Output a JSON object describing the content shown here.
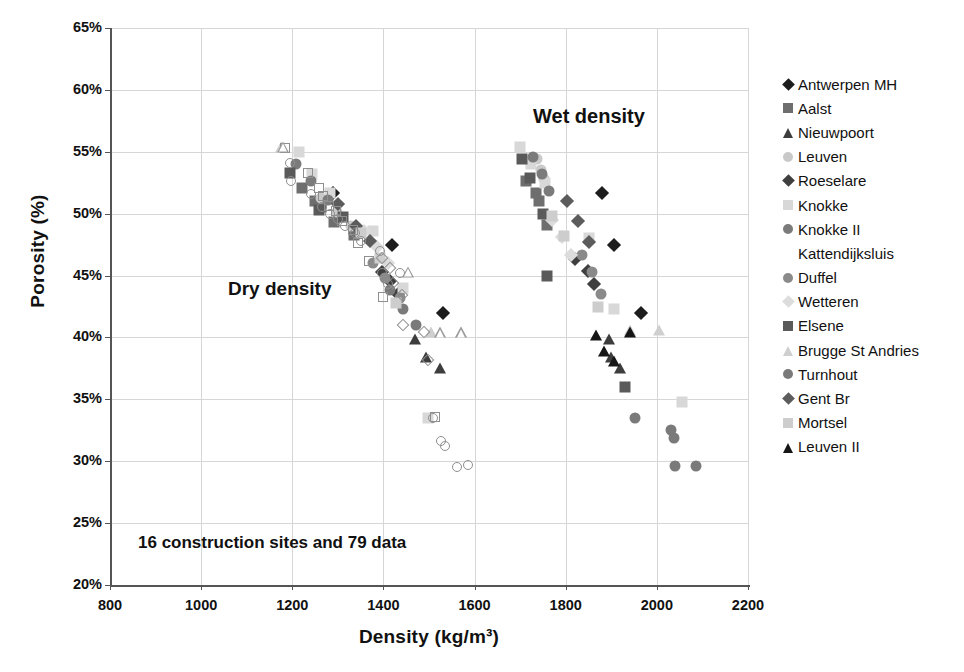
{
  "chart_data": {
    "type": "scatter",
    "title": "",
    "xlabel": "Density (kg/m³)",
    "ylabel": "Porosity (%)",
    "xlim": [
      800,
      2200
    ],
    "ylim": [
      20,
      65
    ],
    "xticks": [
      800,
      1000,
      1200,
      1400,
      1600,
      1800,
      2000,
      2200
    ],
    "yticks": [
      "20%",
      "25%",
      "30%",
      "35%",
      "40%",
      "45%",
      "50%",
      "55%",
      "60%",
      "65%"
    ],
    "ytick_values": [
      20,
      25,
      30,
      35,
      40,
      45,
      50,
      55,
      60,
      65
    ],
    "grid": true,
    "legend_position": "right",
    "annotations": [
      {
        "text": "Dry density",
        "x": 1300,
        "y": 45.5
      },
      {
        "text": "Wet density",
        "x": 1760,
        "y": 59.0
      },
      {
        "text": "16 construction sites and 79 data",
        "x": 860,
        "y": 24.2
      }
    ],
    "series": [
      {
        "name": "Antwerpen MH",
        "marker": "diamond",
        "color": "#1d1d1d",
        "size": 10,
        "points": [
          [
            1290,
            51.7
          ],
          [
            1419,
            47.5
          ],
          [
            1530,
            42.0
          ],
          [
            1880,
            51.7
          ],
          [
            1905,
            47.5
          ],
          [
            1966,
            42.0
          ]
        ]
      },
      {
        "name": "Aalst",
        "marker": "square",
        "color": "#6e6e6e",
        "size": 11,
        "points": [
          [
            1222,
            52.1
          ],
          [
            1249,
            51.0
          ],
          [
            1262,
            50.5
          ],
          [
            1292,
            49.3
          ],
          [
            1336,
            48.3
          ],
          [
            1712,
            52.6
          ],
          [
            1735,
            51.7
          ],
          [
            1742,
            51.0
          ],
          [
            1758,
            49.1
          ]
        ]
      },
      {
        "name": "Nieuwpoort",
        "marker": "triangle",
        "color": "#3d3d3d",
        "size": 11,
        "points": [
          [
            1470,
            39.9
          ],
          [
            1494,
            38.4
          ],
          [
            1525,
            37.5
          ],
          [
            1895,
            39.9
          ],
          [
            1900,
            38.4
          ],
          [
            1920,
            37.5
          ]
        ]
      },
      {
        "name": "Leuven",
        "marker": "circle",
        "color": "#c9c9c9",
        "size": 11,
        "points": [
          [
            1263,
            51.3
          ],
          [
            1299,
            50.1
          ],
          [
            1329,
            49.0
          ],
          [
            1737,
            54.4
          ],
          [
            1745,
            53.5
          ],
          [
            1752,
            52.8
          ]
        ]
      },
      {
        "name": "Roeselare",
        "marker": "diamond",
        "color": "#3f3f3f",
        "size": 10,
        "points": [
          [
            1396,
            45.3
          ],
          [
            1415,
            44.6
          ],
          [
            1432,
            43.5
          ],
          [
            1820,
            46.3
          ],
          [
            1848,
            45.4
          ],
          [
            1862,
            44.3
          ]
        ]
      },
      {
        "name": "Knokke",
        "marker": "square",
        "color": "#d8d8d8",
        "size": 11,
        "points": [
          [
            1215,
            55.0
          ],
          [
            1244,
            53.2
          ],
          [
            1283,
            51.7
          ],
          [
            1378,
            48.6
          ],
          [
            1444,
            44.0
          ],
          [
            1497,
            33.5
          ],
          [
            1700,
            55.4
          ],
          [
            1724,
            54.0
          ],
          [
            1754,
            52.5
          ],
          [
            1852,
            48.0
          ],
          [
            1906,
            42.3
          ],
          [
            2055,
            34.8
          ]
        ]
      },
      {
        "name": "Knokke II Kattendijksluis",
        "marker": "circle",
        "color": "#7b7b7b",
        "size": 11,
        "points": [
          [
            1209,
            54.0
          ],
          [
            1240,
            52.6
          ],
          [
            1278,
            51.1
          ],
          [
            1728,
            54.6
          ],
          [
            1747,
            53.2
          ],
          [
            1763,
            51.8
          ]
        ]
      },
      {
        "name": "Duffel",
        "marker": "circle",
        "color": "#8a8a8a",
        "size": 11,
        "points": [
          [
            1378,
            46.0
          ],
          [
            1404,
            44.8
          ],
          [
            1436,
            43.2
          ],
          [
            1836,
            46.7
          ],
          [
            1858,
            45.3
          ],
          [
            1877,
            43.5
          ]
        ]
      },
      {
        "name": "Wetteren",
        "marker": "diamond",
        "color": "#dcdcdc",
        "size": 10,
        "points": [
          [
            1358,
            48.6
          ],
          [
            1385,
            47.3
          ],
          [
            1411,
            46.0
          ],
          [
            1770,
            49.5
          ],
          [
            1791,
            48.1
          ],
          [
            1812,
            46.7
          ]
        ]
      },
      {
        "name": "Elsene",
        "marker": "square",
        "color": "#5a5a5a",
        "size": 11,
        "points": [
          [
            1196,
            53.3
          ],
          [
            1258,
            50.3
          ],
          [
            1312,
            49.7
          ],
          [
            1703,
            54.4
          ],
          [
            1722,
            52.9
          ],
          [
            1751,
            50.0
          ],
          [
            1758,
            45.0
          ],
          [
            1930,
            36.0
          ]
        ]
      },
      {
        "name": "Brugge St Andries",
        "marker": "triangle",
        "color": "#cfcfcf",
        "size": 11,
        "points": [
          [
            1176,
            55.4
          ],
          [
            1504,
            40.4
          ],
          [
            1570,
            40.4
          ],
          [
            1942,
            40.6
          ],
          [
            2005,
            40.6
          ]
        ]
      },
      {
        "name": "Turnhout",
        "marker": "circle",
        "color": "#7a7a7a",
        "size": 11,
        "points": [
          [
            1414,
            43.8
          ],
          [
            1444,
            42.3
          ],
          [
            1471,
            41.0
          ],
          [
            1952,
            33.5
          ],
          [
            2032,
            32.5
          ],
          [
            2038,
            31.9
          ],
          [
            2039,
            29.6
          ],
          [
            2085,
            29.6
          ]
        ]
      },
      {
        "name": "Gent Br",
        "marker": "diamond",
        "color": "#5c5c5c",
        "size": 10,
        "points": [
          [
            1300,
            50.8
          ],
          [
            1340,
            49.0
          ],
          [
            1370,
            47.8
          ],
          [
            1802,
            51.0
          ],
          [
            1828,
            49.4
          ],
          [
            1852,
            47.7
          ]
        ]
      },
      {
        "name": "Mortsel",
        "marker": "square",
        "color": "#cdcdcd",
        "size": 11,
        "points": [
          [
            1350,
            48.4
          ],
          [
            1392,
            46.4
          ],
          [
            1428,
            42.8
          ],
          [
            1770,
            49.8
          ],
          [
            1797,
            48.2
          ],
          [
            1870,
            42.5
          ]
        ]
      },
      {
        "name": "Leuven II",
        "marker": "triangle",
        "color": "#161616",
        "size": 11,
        "points": [
          [
            1866,
            40.2
          ],
          [
            1885,
            38.9
          ],
          [
            1905,
            38.1
          ],
          [
            1942,
            40.4
          ]
        ]
      },
      {
        "name": "Dry open circles",
        "marker": "circle-open",
        "color": "#8f8f8f",
        "size": 11,
        "points": [
          [
            1195,
            54.1
          ],
          [
            1197,
            52.6
          ],
          [
            1241,
            51.6
          ],
          [
            1265,
            50.5
          ],
          [
            1282,
            50.0
          ],
          [
            1300,
            49.6
          ],
          [
            1315,
            49.0
          ],
          [
            1338,
            48.4
          ],
          [
            1350,
            47.8
          ],
          [
            1392,
            47.0
          ],
          [
            1397,
            45.2
          ],
          [
            1410,
            44.3
          ],
          [
            1437,
            45.2
          ],
          [
            1508,
            33.5
          ],
          [
            1527,
            31.6
          ],
          [
            1536,
            31.2
          ],
          [
            1561,
            29.5
          ],
          [
            1585,
            29.7
          ]
        ]
      },
      {
        "name": "Dry open squares",
        "marker": "square-open",
        "color": "#8f8f8f",
        "size": 11,
        "points": [
          [
            1185,
            55.3
          ],
          [
            1234,
            53.3
          ],
          [
            1258,
            52.1
          ],
          [
            1268,
            51.4
          ],
          [
            1281,
            50.6
          ],
          [
            1296,
            50.2
          ],
          [
            1310,
            49.4
          ],
          [
            1333,
            48.7
          ],
          [
            1344,
            47.6
          ],
          [
            1368,
            46.2
          ],
          [
            1400,
            43.3
          ],
          [
            1513,
            33.6
          ]
        ]
      },
      {
        "name": "Dry open diamonds",
        "marker": "diamond-open",
        "color": "#8f8f8f",
        "size": 10,
        "points": [
          [
            1397,
            46.4
          ],
          [
            1415,
            45.6
          ],
          [
            1421,
            44.4
          ],
          [
            1441,
            43.4
          ],
          [
            1443,
            41.0
          ],
          [
            1489,
            40.4
          ],
          [
            1497,
            38.2
          ]
        ]
      },
      {
        "name": "Dry open triangles",
        "marker": "triangle-open",
        "color": "#9b9b9b",
        "size": 11,
        "points": [
          [
            1180,
            55.4
          ],
          [
            1454,
            45.3
          ],
          [
            1524,
            40.4
          ],
          [
            1570,
            40.4
          ]
        ]
      }
    ]
  },
  "legend": {
    "entries": [
      {
        "label": "Antwerpen MH",
        "marker": "diamond",
        "color": "#1d1d1d"
      },
      {
        "label": "Aalst",
        "marker": "square",
        "color": "#6e6e6e"
      },
      {
        "label": "Nieuwpoort",
        "marker": "triangle",
        "color": "#3d3d3d"
      },
      {
        "label": "Leuven",
        "marker": "circle",
        "color": "#c9c9c9"
      },
      {
        "label": "Roeselare",
        "marker": "diamond",
        "color": "#3f3f3f"
      },
      {
        "label": "Knokke",
        "marker": "square",
        "color": "#d8d8d8"
      },
      {
        "label": "Knokke II",
        "marker": "circle",
        "color": "#7b7b7b"
      },
      {
        "label": "Kattendijksluis",
        "marker": "none",
        "color": "#7b7b7b"
      },
      {
        "label": "Duffel",
        "marker": "circle",
        "color": "#8a8a8a"
      },
      {
        "label": "Wetteren",
        "marker": "diamond",
        "color": "#dcdcdc"
      },
      {
        "label": "Elsene",
        "marker": "square",
        "color": "#5a5a5a"
      },
      {
        "label": "Brugge St Andries",
        "marker": "triangle",
        "color": "#cfcfcf"
      },
      {
        "label": "Turnhout",
        "marker": "circle",
        "color": "#7a7a7a"
      },
      {
        "label": "Gent Br",
        "marker": "diamond",
        "color": "#5c5c5c"
      },
      {
        "label": "Mortsel",
        "marker": "square",
        "color": "#cdcdcd"
      },
      {
        "label": "Leuven II",
        "marker": "triangle",
        "color": "#161616"
      }
    ]
  },
  "colors": {
    "grid": "#d6d6d6",
    "axis": "#555555",
    "text": "#111111",
    "background": "#ffffff"
  }
}
